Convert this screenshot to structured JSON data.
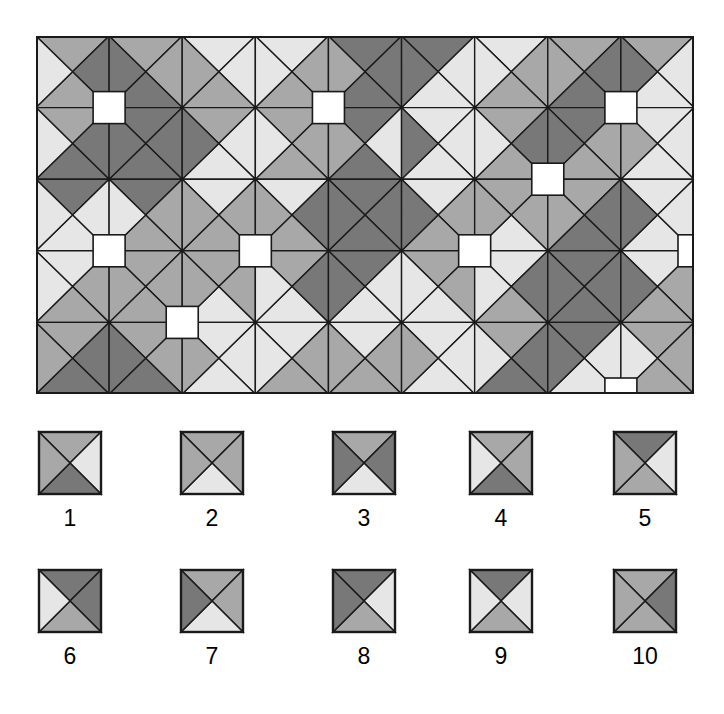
{
  "figure": {
    "kind": "tiling-pattern-figure",
    "background": "#ffffff",
    "stroke_color": "#1a1a1a"
  },
  "palette": {
    "dark": "#787878",
    "medium": "#a8a8a8",
    "light": "#e6e6e6",
    "white": "#ffffff",
    "outline": "#1a1a1a"
  },
  "pattern_panel": {
    "x": 36,
    "y": 36,
    "width": 658,
    "height": 358,
    "cols": 9,
    "rows": 5,
    "cell": 73.1,
    "border_color": "#1a1a1a",
    "description": "Rectangular field of square tiles, each divided by both diagonals into four triangles; matching-colour triangles of neighbouring tiles merge into larger octagons and diamonds, and white squares sit at some tile corners.",
    "grid": [
      [
        {
          "t": "medium",
          "r": "dark",
          "b": "medium",
          "l": "light"
        },
        {
          "t": "medium",
          "r": "medium",
          "b": "dark",
          "l": "dark"
        },
        {
          "t": "light",
          "r": "light",
          "b": "medium",
          "l": "medium"
        },
        {
          "t": "light",
          "r": "medium",
          "b": "medium",
          "l": "light"
        },
        {
          "t": "dark",
          "r": "dark",
          "b": "dark",
          "l": "medium"
        },
        {
          "t": "dark",
          "r": "light",
          "b": "light",
          "l": "dark"
        },
        {
          "t": "light",
          "r": "medium",
          "b": "medium",
          "l": "light"
        },
        {
          "t": "medium",
          "r": "dark",
          "b": "dark",
          "l": "medium"
        },
        {
          "t": "medium",
          "r": "light",
          "b": "light",
          "l": "dark"
        }
      ],
      [
        {
          "t": "medium",
          "r": "dark",
          "b": "dark",
          "l": "light"
        },
        {
          "t": "dark",
          "r": "dark",
          "b": "dark",
          "l": "dark"
        },
        {
          "t": "medium",
          "r": "light",
          "b": "light",
          "l": "dark"
        },
        {
          "t": "medium",
          "r": "medium",
          "b": "medium",
          "l": "light"
        },
        {
          "t": "dark",
          "r": "light",
          "b": "dark",
          "l": "medium"
        },
        {
          "t": "light",
          "r": "light",
          "b": "light",
          "l": "dark"
        },
        {
          "t": "medium",
          "r": "dark",
          "b": "medium",
          "l": "light"
        },
        {
          "t": "dark",
          "r": "medium",
          "b": "medium",
          "l": "dark"
        },
        {
          "t": "light",
          "r": "light",
          "b": "light",
          "l": "medium"
        }
      ],
      [
        {
          "t": "dark",
          "r": "light",
          "b": "light",
          "l": "light"
        },
        {
          "t": "dark",
          "r": "medium",
          "b": "medium",
          "l": "light"
        },
        {
          "t": "light",
          "r": "medium",
          "b": "medium",
          "l": "medium"
        },
        {
          "t": "light",
          "r": "dark",
          "b": "medium",
          "l": "medium"
        },
        {
          "t": "dark",
          "r": "dark",
          "b": "dark",
          "l": "dark"
        },
        {
          "t": "light",
          "r": "medium",
          "b": "medium",
          "l": "dark"
        },
        {
          "t": "medium",
          "r": "medium",
          "b": "light",
          "l": "medium"
        },
        {
          "t": "medium",
          "r": "dark",
          "b": "dark",
          "l": "medium"
        },
        {
          "t": "light",
          "r": "light",
          "b": "light",
          "l": "dark"
        }
      ],
      [
        {
          "t": "light",
          "r": "medium",
          "b": "medium",
          "l": "light"
        },
        {
          "t": "medium",
          "r": "medium",
          "b": "medium",
          "l": "medium"
        },
        {
          "t": "medium",
          "r": "medium",
          "b": "light",
          "l": "medium"
        },
        {
          "t": "medium",
          "r": "dark",
          "b": "light",
          "l": "light"
        },
        {
          "t": "dark",
          "r": "light",
          "b": "light",
          "l": "dark"
        },
        {
          "t": "medium",
          "r": "medium",
          "b": "light",
          "l": "light"
        },
        {
          "t": "light",
          "r": "dark",
          "b": "medium",
          "l": "light"
        },
        {
          "t": "dark",
          "r": "dark",
          "b": "dark",
          "l": "dark"
        },
        {
          "t": "light",
          "r": "medium",
          "b": "medium",
          "l": "dark"
        }
      ],
      [
        {
          "t": "medium",
          "r": "dark",
          "b": "dark",
          "l": "medium"
        },
        {
          "t": "medium",
          "r": "medium",
          "b": "dark",
          "l": "dark"
        },
        {
          "t": "light",
          "r": "light",
          "b": "light",
          "l": "medium"
        },
        {
          "t": "light",
          "r": "medium",
          "b": "medium",
          "l": "light"
        },
        {
          "t": "light",
          "r": "medium",
          "b": "medium",
          "l": "medium"
        },
        {
          "t": "light",
          "r": "light",
          "b": "light",
          "l": "medium"
        },
        {
          "t": "medium",
          "r": "dark",
          "b": "dark",
          "l": "light"
        },
        {
          "t": "dark",
          "r": "light",
          "b": "light",
          "l": "dark"
        },
        {
          "t": "medium",
          "r": "medium",
          "b": "medium",
          "l": "light"
        }
      ]
    ],
    "white_squares": [
      {
        "col": 1,
        "row": 1
      },
      {
        "col": 4,
        "row": 1
      },
      {
        "col": 8,
        "row": 1
      },
      {
        "col": 7,
        "row": 2
      },
      {
        "col": 1,
        "row": 3
      },
      {
        "col": 3,
        "row": 3
      },
      {
        "col": 6,
        "row": 3
      },
      {
        "col": 9,
        "row": 3
      },
      {
        "col": 2,
        "row": 4
      },
      {
        "col": 8,
        "row": 5
      }
    ],
    "white_square_size": 32
  },
  "legend": {
    "tile_size": 62,
    "rows": [
      {
        "row_index": 1,
        "tiles": [
          {
            "label": "1",
            "x": 39,
            "top": "medium",
            "right": "light",
            "bottom": "dark",
            "left": "medium"
          },
          {
            "label": "2",
            "x": 181,
            "top": "medium",
            "right": "medium",
            "bottom": "light",
            "left": "medium"
          },
          {
            "label": "3",
            "x": 333,
            "top": "medium",
            "right": "dark",
            "bottom": "light",
            "left": "dark"
          },
          {
            "label": "4",
            "x": 470,
            "top": "medium",
            "right": "medium",
            "bottom": "dark",
            "left": "light"
          },
          {
            "label": "5",
            "x": 614,
            "top": "dark",
            "right": "light",
            "bottom": "medium",
            "left": "medium"
          }
        ]
      },
      {
        "row_index": 2,
        "tiles": [
          {
            "label": "6",
            "x": 39,
            "top": "dark",
            "right": "dark",
            "bottom": "medium",
            "left": "light"
          },
          {
            "label": "7",
            "x": 181,
            "top": "medium",
            "right": "medium",
            "bottom": "light",
            "left": "dark"
          },
          {
            "label": "8",
            "x": 333,
            "top": "dark",
            "right": "light",
            "bottom": "medium",
            "left": "dark"
          },
          {
            "label": "9",
            "x": 470,
            "top": "dark",
            "right": "light",
            "bottom": "medium",
            "left": "light"
          },
          {
            "label": "10",
            "x": 614,
            "top": "medium",
            "right": "dark",
            "bottom": "medium",
            "left": "medium"
          }
        ]
      }
    ]
  }
}
